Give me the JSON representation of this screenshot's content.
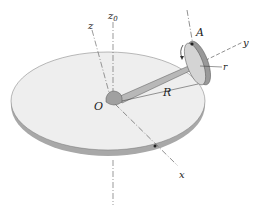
{
  "figure": {
    "labels": {
      "z": "z",
      "z0": "z",
      "z0_sub": "0",
      "y": "y",
      "x": "x",
      "O": "O",
      "A": "A",
      "R": "R",
      "r": "r"
    },
    "colors": {
      "disk_top": "#eeeeee",
      "disk_edge": "#a8a8a8",
      "arm": "#b8b8b8",
      "wheel": "#cfcfcf",
      "line": "#333333"
    }
  }
}
